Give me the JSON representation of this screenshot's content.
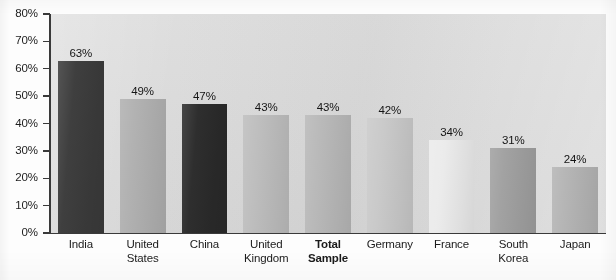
{
  "chart_data": {
    "type": "bar",
    "title": "",
    "title_cropped": true,
    "xlabel": "",
    "ylabel": "",
    "ylim": [
      0,
      80
    ],
    "grid": false,
    "legend": "none",
    "value_suffix": "%",
    "categories": [
      "India",
      "United States",
      "China",
      "United Kingdom",
      "Total Sample",
      "Germany",
      "France",
      "South Korea",
      "Japan"
    ],
    "values": [
      63,
      49,
      47,
      43,
      43,
      42,
      34,
      31,
      24
    ],
    "data_labels": [
      "63%",
      "49%",
      "47%",
      "43%",
      "43%",
      "42%",
      "34%",
      "31%",
      "24%"
    ],
    "bar_colors": [
      "#3b3b3b",
      "#b0b0b0",
      "#2a2a2a",
      "#bdbdbd",
      "#b8b8b8",
      "#c9c9c9",
      "#ebebeb",
      "#a0a0a0",
      "#b4b4b4"
    ],
    "highlight_category": "Total Sample",
    "yticks": [
      0,
      10,
      20,
      30,
      40,
      50,
      60,
      70,
      80
    ],
    "ytick_labels": [
      "0%",
      "10%",
      "20%",
      "30%",
      "40%",
      "50%",
      "60%",
      "70%",
      "80%"
    ]
  },
  "axis": {
    "y_labels": [
      "80%",
      "70%",
      "60%",
      "50%",
      "40%",
      "30%",
      "20%",
      "10%",
      "0%"
    ]
  },
  "categories_display": [
    {
      "line1": "India",
      "line2": "",
      "bold": false
    },
    {
      "line1": "United",
      "line2": "States",
      "bold": false
    },
    {
      "line1": "China",
      "line2": "",
      "bold": false
    },
    {
      "line1": "United",
      "line2": "Kingdom",
      "bold": false
    },
    {
      "line1": "Total",
      "line2": "Sample",
      "bold": true
    },
    {
      "line1": "Germany",
      "line2": "",
      "bold": false
    },
    {
      "line1": "France",
      "line2": "",
      "bold": false
    },
    {
      "line1": "South",
      "line2": "Korea",
      "bold": false
    },
    {
      "line1": "Japan",
      "line2": "",
      "bold": false
    }
  ],
  "colors": {
    "plot_background": "#d8d8d8",
    "axis": "#3a3a3a",
    "text": "#1b1b1b"
  },
  "title": {
    "cropped_text": ""
  }
}
